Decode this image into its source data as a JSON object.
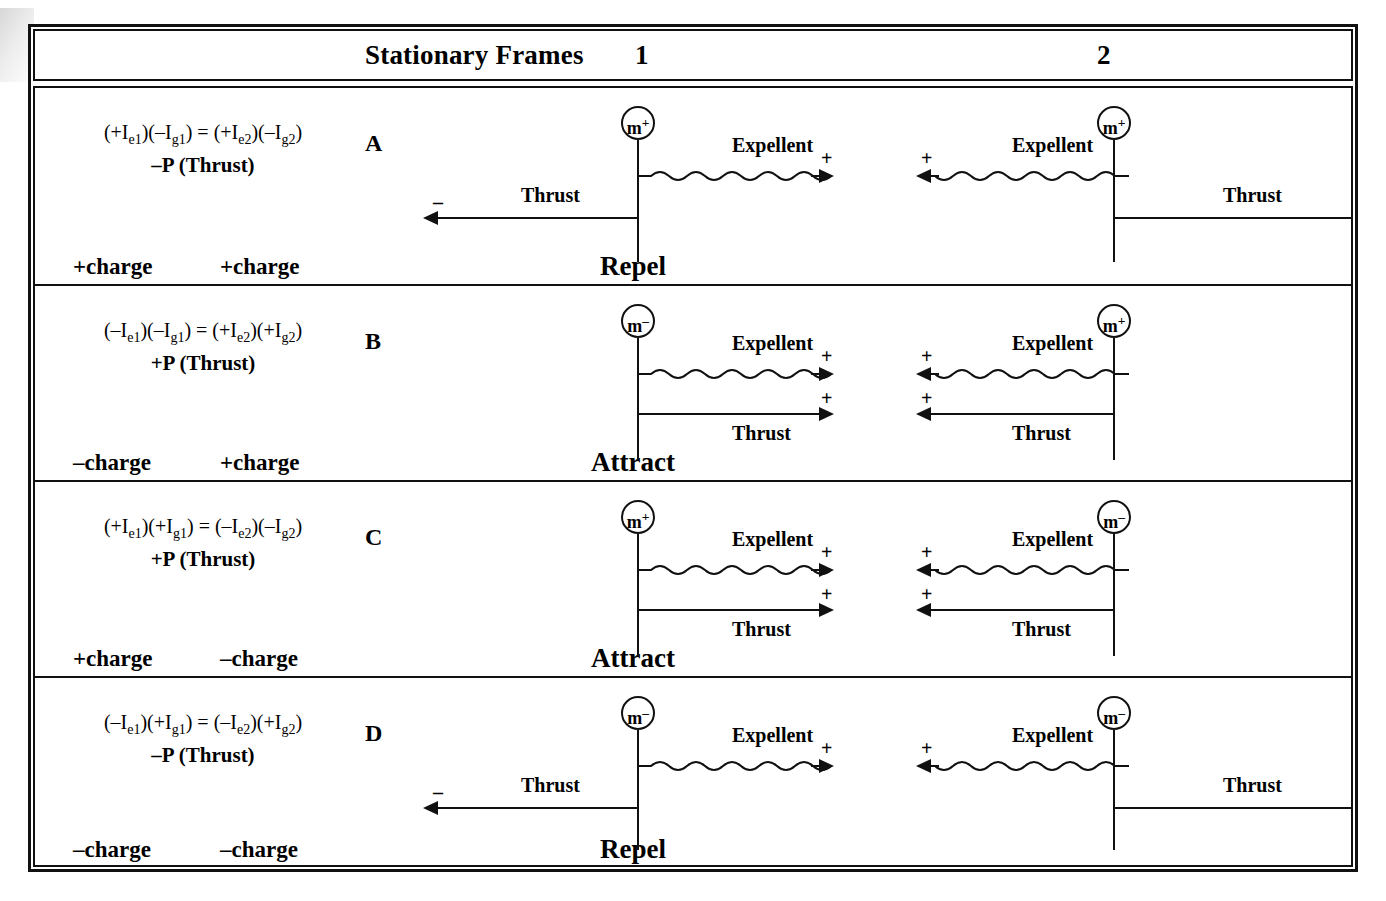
{
  "header": {
    "title": "Stationary Frames",
    "frame1": "1",
    "frame2": "2"
  },
  "labels": {
    "expellent": "Expellent",
    "thrust": "Thrust",
    "plus": "+",
    "minus": "–"
  },
  "rows": [
    {
      "letter": "A",
      "equation_line1": "(+Iₑ₁)(–Iₑ₁) = (+Iₑ₂)(–Iₑ₂)",
      "eq_l1_parts": {
        "p1": "(+I",
        "s1": "e1",
        "p2": ")(–I",
        "s2": "g1",
        "p3": ") = (+I",
        "s3": "e2",
        "p4": ")(–I",
        "s4": "g2",
        "p5": ")"
      },
      "equation_line2": "–P (Thrust)",
      "mass_left": "m",
      "mass_left_sign": "+",
      "mass_right": "m",
      "mass_right_sign": "+",
      "charge_left": "+charge",
      "charge_right": "+charge",
      "result": "Repel",
      "expellent_left": "Expellent",
      "expellent_right": "Expellent",
      "expellent_left_sign": "+",
      "expellent_right_sign": "+",
      "thrust_left": "Thrust",
      "thrust_right": "Thrust",
      "thrust_left_sign": "–",
      "thrust_right_sign": "–",
      "thrust_style": "outward"
    },
    {
      "letter": "B",
      "equation_line1": "(–Iₑ₁)(–Iₑ₁) = (+Iₑ₂)(+Iₑ₂)",
      "eq_l1_parts": {
        "p1": "(–I",
        "s1": "e1",
        "p2": ")(–I",
        "s2": "g1",
        "p3": ") = (+I",
        "s3": "e2",
        "p4": ")(+I",
        "s4": "g2",
        "p5": ")"
      },
      "equation_line2": "+P (Thrust)",
      "mass_left": "m",
      "mass_left_sign": "–",
      "mass_right": "m",
      "mass_right_sign": "+",
      "charge_left": "–charge",
      "charge_right": "+charge",
      "result": "Attract",
      "expellent_left": "Expellent",
      "expellent_right": "Expellent",
      "expellent_left_sign": "+",
      "expellent_right_sign": "+",
      "thrust_left": "Thrust",
      "thrust_right": "Thrust",
      "thrust_left_sign": "+",
      "thrust_right_sign": "+",
      "thrust_style": "inward"
    },
    {
      "letter": "C",
      "equation_line1": "(+Iₑ₁)(+Iₑ₁) = (–Iₑ₂)(–Iₑ₂)",
      "eq_l1_parts": {
        "p1": "(+I",
        "s1": "e1",
        "p2": ")(+I",
        "s2": "g1",
        "p3": ") = (–I",
        "s3": "e2",
        "p4": ")(–I",
        "s4": "g2",
        "p5": ")"
      },
      "equation_line2": "+P (Thrust)",
      "mass_left": "m",
      "mass_left_sign": "+",
      "mass_right": "m",
      "mass_right_sign": "–",
      "charge_left": "+charge",
      "charge_right": "–charge",
      "result": "Attract",
      "expellent_left": "Expellent",
      "expellent_right": "Expellent",
      "expellent_left_sign": "+",
      "expellent_right_sign": "+",
      "thrust_left": "Thrust",
      "thrust_right": "Thrust",
      "thrust_left_sign": "+",
      "thrust_right_sign": "+",
      "thrust_style": "inward"
    },
    {
      "letter": "D",
      "equation_line1": "(–Iₑ₁)(+Iₑ₁) = (–Iₑ₂)(+Iₑ₂)",
      "eq_l1_parts": {
        "p1": "(–I",
        "s1": "e1",
        "p2": ")(+I",
        "s2": "g1",
        "p3": ") = (–I",
        "s3": "e2",
        "p4": ")(+I",
        "s4": "g2",
        "p5": ")"
      },
      "equation_line2": "–P (Thrust)",
      "mass_left": "m",
      "mass_left_sign": "–",
      "mass_right": "m",
      "mass_right_sign": "–",
      "charge_left": "–charge",
      "charge_right": "–charge",
      "result": "Repel",
      "expellent_left": "Expellent",
      "expellent_right": "Expellent",
      "expellent_left_sign": "+",
      "expellent_right_sign": "+",
      "thrust_left": "Thrust",
      "thrust_right": "Thrust",
      "thrust_left_sign": "–",
      "thrust_right_sign": "–",
      "thrust_style": "outward"
    }
  ],
  "colors": {
    "ink": "#111111",
    "paper": "#ffffff"
  }
}
